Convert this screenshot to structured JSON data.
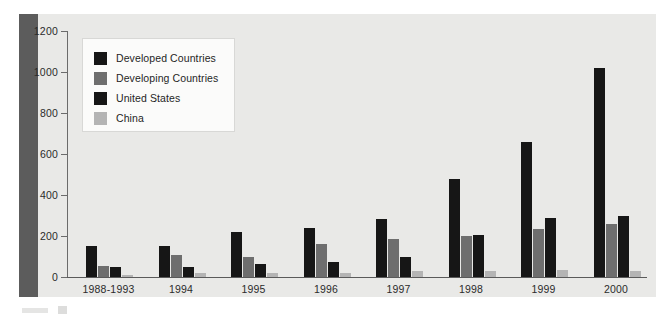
{
  "figure": {
    "panel_background": "#e9e9e7",
    "left_band_color": "#5c5c5c"
  },
  "legend": {
    "position": "inside-top-left",
    "entries": [
      {
        "label": "Developed Countries",
        "color": "#161616",
        "swatch_icon": "legend-swatch-square"
      },
      {
        "label": "Developing Countries",
        "color": "#6e6e6e",
        "swatch_icon": "legend-swatch-square"
      },
      {
        "label": "United States",
        "color": "#161616",
        "swatch_icon": "legend-swatch-square"
      },
      {
        "label": "China",
        "color": "#b4b4b4",
        "swatch_icon": "legend-swatch-square"
      }
    ]
  },
  "axes": {
    "y_ticks": [
      0,
      200,
      400,
      600,
      800,
      1000,
      1200
    ],
    "y_min": 0,
    "y_max": 1200,
    "x_categories": [
      "1988-1993",
      "1994",
      "1995",
      "1996",
      "1997",
      "1998",
      "1999",
      "2000"
    ]
  },
  "chart_data": {
    "type": "bar",
    "title": "",
    "subtitle": "",
    "xlabel": "",
    "ylabel": "",
    "ylim": [
      0,
      1200
    ],
    "yticks": [
      0,
      200,
      400,
      600,
      800,
      1000,
      1200
    ],
    "grid": false,
    "legend_position": "upper-left-inside",
    "categories": [
      "1988-1993",
      "1994",
      "1995",
      "1996",
      "1997",
      "1998",
      "1999",
      "2000"
    ],
    "series": [
      {
        "name": "Developed Countries",
        "color": "#161616",
        "values": [
          150,
          152,
          220,
          240,
          285,
          480,
          660,
          1020
        ]
      },
      {
        "name": "Developing Countries",
        "color": "#6e6e6e",
        "values": [
          52,
          108,
          100,
          160,
          185,
          198,
          232,
          258
        ]
      },
      {
        "name": "United States",
        "color": "#161616",
        "values": [
          48,
          47,
          65,
          75,
          100,
          205,
          290,
          300
        ]
      },
      {
        "name": "China",
        "color": "#b4b4b4",
        "values": [
          8,
          22,
          22,
          22,
          28,
          30,
          32,
          28
        ]
      }
    ]
  }
}
